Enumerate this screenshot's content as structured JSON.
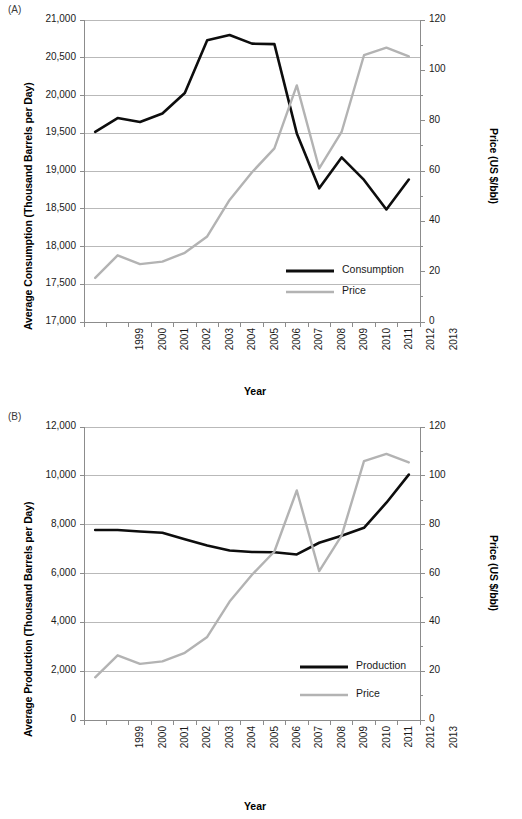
{
  "figure": {
    "panels": [
      {
        "tag": "(A)",
        "ylabel_left": "Average Consumption (Thousand Barrels per Day)",
        "ylabel_right": "Price (US $/bbl)",
        "xlabel": "Year"
      },
      {
        "tag": "(B)",
        "ylabel_left": "Average Production (Thousand Barrels per Day)",
        "ylabel_right": "Price (US $/bbl)",
        "xlabel": "Year"
      }
    ]
  },
  "colors": {
    "series_black": "#0d0d0d",
    "series_gray": "#b3b3b3",
    "grid": "#b9b9b9",
    "axis": "#8c8c8c",
    "text": "#1a1a1a"
  },
  "chart_data": [
    {
      "type": "line",
      "title": "(A)",
      "xlabel": "Year",
      "ylabel": "Average Consumption (Thousand Barrels per Day)",
      "ylabel_secondary": "Price (US $/bbl)",
      "grid": true,
      "legend_position": "center-right-inside",
      "x": [
        1999,
        2000,
        2001,
        2002,
        2003,
        2004,
        2005,
        2006,
        2007,
        2008,
        2009,
        2010,
        2011,
        2012,
        2013
      ],
      "xticklabels": [
        "1999",
        "2000",
        "2001",
        "2002",
        "2003",
        "2004",
        "2005",
        "2006",
        "2007",
        "2008",
        "2009",
        "2010",
        "2011",
        "2012",
        "2013"
      ],
      "ylim": [
        17000,
        21000
      ],
      "yticks": [
        17000,
        17500,
        18000,
        18500,
        19000,
        19500,
        20000,
        20500,
        21000
      ],
      "yticklabels": [
        "17,000",
        "17,500",
        "18,000",
        "18,500",
        "19,000",
        "19,500",
        "20,000",
        "20,500",
        "21,000"
      ],
      "ylim_secondary": [
        0,
        120
      ],
      "yticks_secondary": [
        0,
        20,
        40,
        60,
        80,
        100,
        120
      ],
      "yticklabels_secondary": [
        "0",
        "20",
        "40",
        "60",
        "80",
        "100",
        "120"
      ],
      "series": [
        {
          "name": "Consumption",
          "axis": "left",
          "color": "#0d0d0d",
          "values": [
            19519,
            19701,
            19649,
            19761,
            20034,
            20731,
            20802,
            20687,
            20680,
            19498,
            18771,
            19180,
            18882,
            18490,
            18887
          ]
        },
        {
          "name": "Price",
          "axis": "right",
          "color": "#b3b3b3",
          "values": [
            17.5,
            26.5,
            23.0,
            24.0,
            27.5,
            34.0,
            48.5,
            59.5,
            69.0,
            94.0,
            61.0,
            75.5,
            106.0,
            109.0,
            105.5
          ]
        }
      ]
    },
    {
      "type": "line",
      "title": "(B)",
      "xlabel": "Year",
      "ylabel": "Average Production (Thousand Barrels per Day)",
      "ylabel_secondary": "Price (US $/bbl)",
      "grid": true,
      "legend_position": "center-right-inside",
      "x": [
        1999,
        2000,
        2001,
        2002,
        2003,
        2004,
        2005,
        2006,
        2007,
        2008,
        2009,
        2010,
        2011,
        2012,
        2013
      ],
      "xticklabels": [
        "1999",
        "2000",
        "2001",
        "2002",
        "2003",
        "2004",
        "2005",
        "2006",
        "2007",
        "2008",
        "2009",
        "2010",
        "2011",
        "2012",
        "2013"
      ],
      "ylim": [
        0,
        12000
      ],
      "yticks": [
        0,
        2000,
        4000,
        6000,
        8000,
        10000,
        12000
      ],
      "yticklabels": [
        "0",
        "2,000",
        "4,000",
        "6,000",
        "8,000",
        "10,000",
        "12,000"
      ],
      "ylim_secondary": [
        0,
        120
      ],
      "yticks_secondary": [
        0,
        20,
        40,
        60,
        80,
        100,
        120
      ],
      "yticklabels_secondary": [
        "0",
        "20",
        "40",
        "60",
        "80",
        "100",
        "120"
      ],
      "series": [
        {
          "name": "Production",
          "axis": "left",
          "color": "#0d0d0d",
          "values": [
            7780,
            7780,
            7720,
            7670,
            7400,
            7150,
            6940,
            6880,
            6870,
            6780,
            7260,
            7550,
            7870,
            8900,
            10050
          ]
        },
        {
          "name": "Price",
          "axis": "right",
          "color": "#b3b3b3",
          "values": [
            17.5,
            26.5,
            23.0,
            24.0,
            27.5,
            34.0,
            48.5,
            59.5,
            69.0,
            94.0,
            61.0,
            75.5,
            106.0,
            109.0,
            105.5
          ]
        }
      ]
    }
  ]
}
